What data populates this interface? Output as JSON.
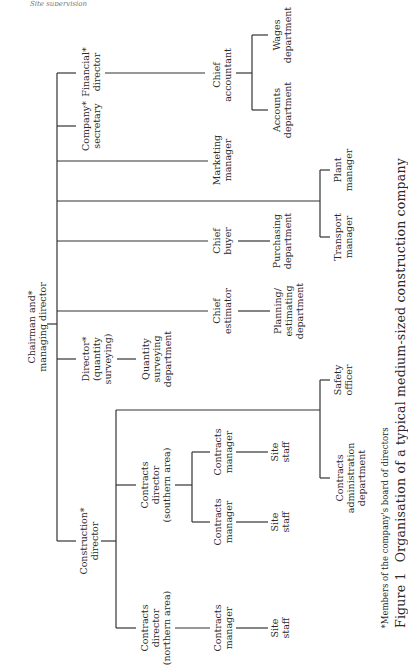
{
  "header": {
    "text": "Site supervision"
  },
  "nodes": {
    "chairman": [
      "Chairman and*",
      "managing director"
    ],
    "financial_director": [
      "Financial*",
      "director"
    ],
    "chief_accountant": [
      "Chief",
      "accountant"
    ],
    "wages_department": [
      "Wages",
      "department"
    ],
    "accounts_department": [
      "Accounts",
      "department"
    ],
    "company_secretary": [
      "Company*",
      "secretary"
    ],
    "marketing_manager": [
      "Marketing",
      "manager"
    ],
    "plant_manager": [
      "Plant",
      "manager"
    ],
    "transport_manager": [
      "Transport",
      "manager"
    ],
    "chief_buyer": [
      "Chief",
      "buyer"
    ],
    "purchasing_department": [
      "Purchasing",
      "department"
    ],
    "chief_estimator": [
      "Chief",
      "estimator"
    ],
    "planning_department": [
      "Planning/",
      "estimating",
      "department"
    ],
    "director_qs": [
      "Director*",
      "(quantity",
      "surveying)"
    ],
    "qs_department": [
      "Quantity",
      "surveying",
      "department"
    ],
    "safety_officer": [
      "Safety",
      "officer"
    ],
    "contracts_admin": [
      "Contracts",
      "administration",
      "department"
    ],
    "construction_director": [
      "Construction*",
      "director"
    ],
    "contracts_director_south": [
      "Contracts",
      "director",
      "(southern area)"
    ],
    "contracts_manager_s1": [
      "Contracts",
      "manager"
    ],
    "site_staff_s1": [
      "Site",
      "staff"
    ],
    "contracts_manager_s2": [
      "Contracts",
      "manager"
    ],
    "site_staff_s2": [
      "Site",
      "staff"
    ],
    "contracts_director_north": [
      "Contracts",
      "director",
      "(northern area)"
    ],
    "contracts_manager_n": [
      "Contracts",
      "manager"
    ],
    "site_staff_n": [
      "Site",
      "staff"
    ]
  },
  "footnote": "*Members of the company's board of directors",
  "caption": {
    "number": "Figure 1",
    "title": "Organisation of a typical medium-sized construction company"
  }
}
